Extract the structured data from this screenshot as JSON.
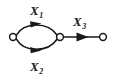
{
  "diagram": {
    "type": "directed-graph",
    "background_color": "#ffffff",
    "stroke_color": "#1a1a1a",
    "node_fill_color": "#ffffff",
    "nodes": [
      {
        "id": "n1",
        "label": "",
        "shape": "open-circle",
        "x": 13,
        "y": 37,
        "r": 3.4
      },
      {
        "id": "n2",
        "label": "",
        "shape": "open-circle",
        "x": 60,
        "y": 37,
        "r": 3.4
      },
      {
        "id": "n3",
        "label": "",
        "shape": "open-circle",
        "x": 103,
        "y": 37,
        "r": 3.4
      }
    ],
    "edges": [
      {
        "id": "e1",
        "label": "X",
        "subscript": "1",
        "from": "n1",
        "to": "n2",
        "style": "curved-up",
        "direction": "forward",
        "arrow_position": "midpoint",
        "label_x": 36,
        "label_y": 17
      },
      {
        "id": "e2",
        "label": "X",
        "subscript": "2",
        "from": "n1",
        "to": "n2",
        "style": "curved-down",
        "direction": "forward",
        "arrow_position": "midpoint",
        "label_x": 36,
        "label_y": 72
      },
      {
        "id": "e3",
        "label": "X",
        "subscript": "3",
        "from": "n2",
        "to": "n3",
        "style": "straight",
        "direction": "forward",
        "arrow_position": "midpoint",
        "label_x": 79,
        "label_y": 27
      }
    ]
  }
}
